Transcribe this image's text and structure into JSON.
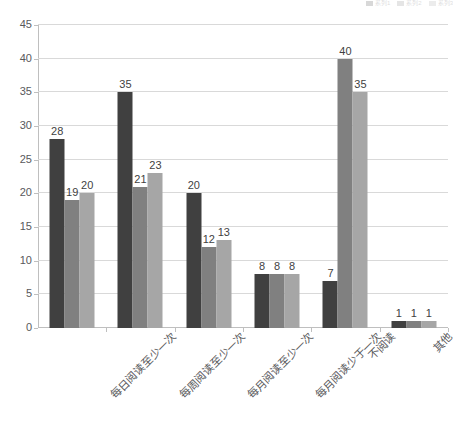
{
  "chart_data": {
    "type": "bar",
    "title": "",
    "xlabel": "",
    "ylabel": "",
    "ylim": [
      0,
      45
    ],
    "ytick_step": 5,
    "yticks": [
      0,
      5,
      10,
      15,
      20,
      25,
      30,
      35,
      40,
      45
    ],
    "grid": true,
    "grid_axis": "y",
    "legend_position": "top-right",
    "legend_visible_partial": true,
    "categories": [
      "每日阅读至少一次",
      "每周阅读至少一次",
      "每月阅读至少一次",
      "每月阅读少于一次",
      "不阅读",
      "其他"
    ],
    "series": [
      {
        "name": "系列1",
        "color": "#404040",
        "values": [
          28,
          35,
          20,
          8,
          7,
          1
        ]
      },
      {
        "name": "系列2",
        "color": "#808080",
        "values": [
          19,
          21,
          12,
          8,
          40,
          1
        ]
      },
      {
        "name": "系列3",
        "color": "#a6a6a6",
        "values": [
          20,
          23,
          13,
          8,
          35,
          1
        ]
      }
    ],
    "data_labels": [
      [
        "28",
        "19",
        "20"
      ],
      [
        "35",
        "21",
        "23"
      ],
      [
        "20",
        "12",
        "13"
      ],
      [
        "8",
        "8",
        "8"
      ],
      [
        "7",
        "40",
        "35"
      ],
      [
        "1",
        "1",
        "1"
      ]
    ]
  },
  "axis": {
    "y_tick_labels": [
      "45",
      "40",
      "35",
      "30",
      "25",
      "20",
      "15",
      "10",
      "5",
      "0"
    ]
  },
  "colors": {
    "series_1": "#404040",
    "series_2": "#808080",
    "series_3": "#a6a6a6",
    "gridline": "#d9d9d9",
    "axis": "#bfbfbf",
    "text": "#59595c",
    "background": "#ffffff"
  }
}
